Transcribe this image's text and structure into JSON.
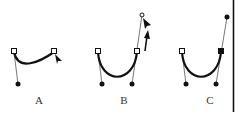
{
  "figure": {
    "panels": [
      {
        "label": "A",
        "description": "Dragging right anchor point to form curve"
      },
      {
        "label": "B",
        "description": "Dragging direction handle upward"
      },
      {
        "label": "C",
        "description": "Resulting curve with extended handle"
      }
    ]
  },
  "colors": {
    "stroke": "#111111",
    "handle_line": "#555555",
    "background": "#ffffff"
  }
}
